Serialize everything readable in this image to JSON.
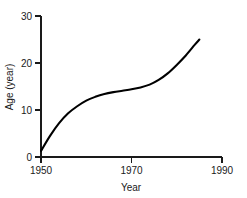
{
  "chart_data": {
    "type": "line",
    "title": "",
    "xlabel": "Year",
    "ylabel": "Age (year)",
    "xlim": [
      1950,
      1990
    ],
    "ylim": [
      0,
      30
    ],
    "xticks": [
      1950,
      1970,
      1990
    ],
    "xtick_labels": [
      "1950",
      "1970",
      "1990"
    ],
    "yticks": [
      0,
      10,
      20,
      30
    ],
    "ytick_labels": [
      "0",
      "10",
      "20",
      "30"
    ],
    "grid": false,
    "legend": "none",
    "series": [
      {
        "name": "Age",
        "color": "#000000",
        "x": [
          1950,
          1952,
          1954,
          1956,
          1958,
          1960,
          1962,
          1964,
          1966,
          1968,
          1970,
          1972,
          1974,
          1976,
          1978,
          1980,
          1982,
          1984,
          1985
        ],
        "values": [
          1.3,
          4.5,
          7.2,
          9.3,
          10.8,
          12.0,
          12.8,
          13.4,
          13.8,
          14.1,
          14.4,
          14.8,
          15.4,
          16.4,
          17.8,
          19.6,
          21.6,
          23.9,
          25.0
        ]
      }
    ]
  },
  "axis": {
    "y_label_0": "0",
    "y_label_10": "10",
    "y_label_20": "20",
    "y_label_30": "30",
    "x_label_1950": "1950",
    "x_label_1970": "1970",
    "x_label_1990": "1990",
    "x_title": "Year",
    "y_title": "Age (year)"
  }
}
